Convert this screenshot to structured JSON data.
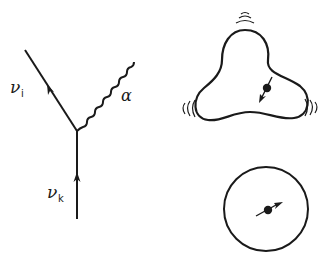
{
  "feynman_vertex": {
    "outgoing_fermion_label": "ν",
    "outgoing_fermion_subscript": "i",
    "incoming_fermion_label": "ν",
    "incoming_fermion_subscript": "k",
    "boson_label": "α"
  },
  "colors": {
    "ink": "#1a1a1a",
    "background": "#ffffff"
  }
}
